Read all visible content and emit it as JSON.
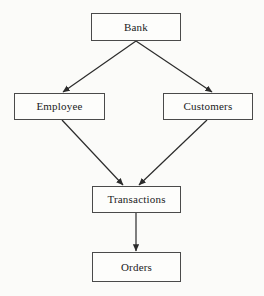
{
  "diagram": {
    "type": "flowchart",
    "background_color": "#fbfbf9",
    "box_fill_color": "#fdfdfb",
    "box_border_color": "#4a4a4a",
    "arrow_color": "#2b2b2b",
    "text_color": "#1b1b1b",
    "nodes": [
      {
        "id": "bank",
        "label": "Bank",
        "x": 91,
        "y": 13,
        "width": 90,
        "height": 28
      },
      {
        "id": "employee",
        "label": "Employee",
        "x": 14,
        "y": 93,
        "width": 91,
        "height": 27
      },
      {
        "id": "customers",
        "label": "Customers",
        "x": 163,
        "y": 93,
        "width": 90,
        "height": 27
      },
      {
        "id": "transactions",
        "label": "Transactions",
        "x": 92,
        "y": 186,
        "width": 89,
        "height": 27
      },
      {
        "id": "orders",
        "label": "Orders",
        "x": 92,
        "y": 252,
        "width": 89,
        "height": 30
      }
    ],
    "edges": [
      {
        "id": "bank-to-employee",
        "from": "bank",
        "to": "employee",
        "x1": 136,
        "y1": 41,
        "x2": 63,
        "y2": 92,
        "arrowhead": true
      },
      {
        "id": "bank-to-customers",
        "from": "bank",
        "to": "customers",
        "x1": 136,
        "y1": 41,
        "x2": 212,
        "y2": 92,
        "arrowhead": true
      },
      {
        "id": "employee-to-transactions",
        "from": "employee",
        "to": "transactions",
        "x1": 62,
        "y1": 120,
        "x2": 123,
        "y2": 185,
        "arrowhead": true
      },
      {
        "id": "customers-to-transactions",
        "from": "customers",
        "to": "transactions",
        "x1": 207,
        "y1": 120,
        "x2": 139,
        "y2": 185,
        "arrowhead": true
      },
      {
        "id": "transactions-to-orders",
        "from": "transactions",
        "to": "orders",
        "x1": 136,
        "y1": 213,
        "x2": 136,
        "y2": 251,
        "arrowhead": true
      }
    ]
  }
}
